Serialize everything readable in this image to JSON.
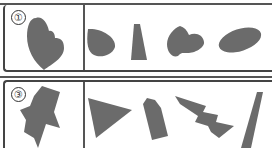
{
  "worksheet": {
    "problems": [
      {
        "number": "①",
        "target_shape": "heart-like combined blob",
        "choices": [
          "drop-shape",
          "trapezoid",
          "heart",
          "ellipse"
        ]
      },
      {
        "number": "③",
        "target_shape": "jagged star-like figure",
        "choices": [
          "triangle",
          "pentagon",
          "lightning-bolt",
          "long-parallelogram"
        ]
      }
    ],
    "shape_color": "#6b6b6b",
    "line_color": "#444444"
  }
}
